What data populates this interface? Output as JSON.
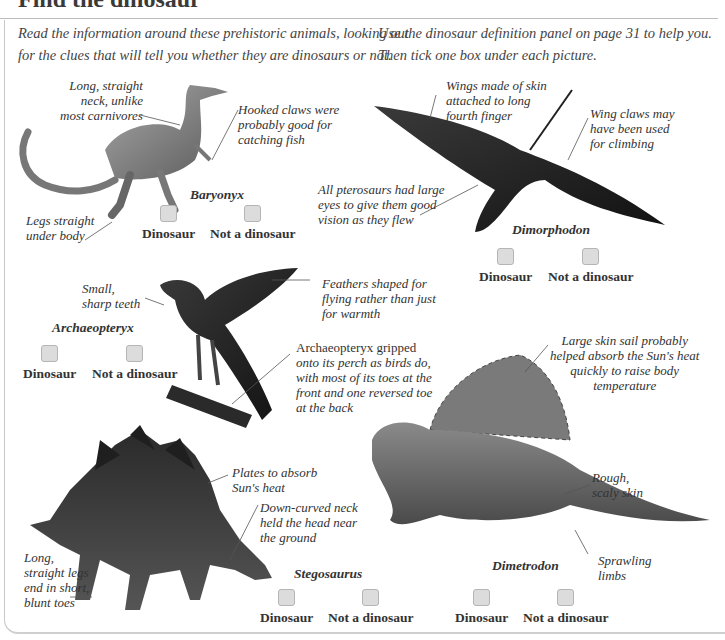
{
  "header": {
    "title": "Find the dinosaur"
  },
  "intro": {
    "left_line1": "Read the information around these prehistoric animals, looking out",
    "left_line2": "for the clues that will tell you whether they are dinosaurs or not.",
    "right_line1": "Use the dinosaur definition panel on page 31 to help you.",
    "right_line2": "Then tick one box under each picture."
  },
  "choices": {
    "dinosaur": "Dinosaur",
    "not_dinosaur": "Not a dinosaur"
  },
  "animals": {
    "baryonyx": {
      "name": "Baryonyx",
      "notes": {
        "neck": [
          "Long, straight",
          "neck, unlike",
          "most carnivores"
        ],
        "claws": [
          "Hooked claws were",
          "probably good for",
          "catching fish"
        ],
        "legs": [
          "Legs straight",
          "under body"
        ]
      }
    },
    "dimorphodon": {
      "name": "Dimorphodon",
      "notes": {
        "wings": [
          "Wings made of skin",
          "attached to long",
          "fourth finger"
        ],
        "claws": [
          "Wing claws may",
          "have been used",
          "for climbing"
        ],
        "eyes": [
          "All pterosaurs had large",
          "eyes to give them good",
          "vision as they flew"
        ]
      }
    },
    "archaeopteryx": {
      "name": "Archaeopteryx",
      "notes": {
        "teeth": [
          "Small,",
          "sharp teeth"
        ],
        "feathers": [
          "Feathers shaped for",
          "flying rather than just",
          "for warmth"
        ],
        "perch": [
          "Archaeopteryx gripped",
          "onto its perch as birds do,",
          "with most of its toes at the",
          "front and one reversed toe",
          "at the back"
        ]
      }
    },
    "dimetrodon": {
      "name": "Dimetrodon",
      "notes": {
        "sail": [
          "Large skin sail probably",
          "helped absorb the Sun's heat",
          "quickly to raise body",
          "temperature"
        ],
        "skin": [
          "Rough,",
          "scaly skin"
        ],
        "limbs": [
          "Sprawling",
          "limbs"
        ]
      }
    },
    "stegosaurus": {
      "name": "Stegosaurus",
      "notes": {
        "plates": [
          "Plates to absorb",
          "Sun's heat"
        ],
        "neck": [
          "Down-curved neck",
          "held the head near",
          "the ground"
        ],
        "legs": [
          "Long,",
          "straight legs",
          "end in short,",
          "blunt toes"
        ]
      }
    }
  },
  "colors": {
    "checkbox_fill": "#dcdcdc",
    "checkbox_border": "#b5b5b5",
    "text": "#333333",
    "panel_border": "#c8c8c8"
  }
}
